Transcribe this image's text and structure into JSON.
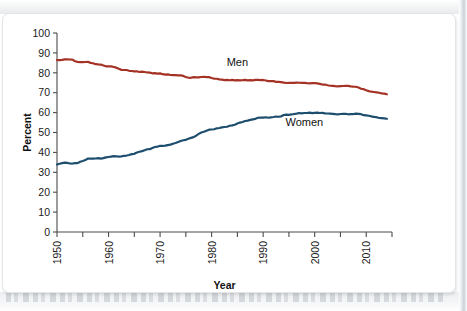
{
  "figure": {
    "background_color": "#ffffff",
    "card_border_color": "#e3e5e7"
  },
  "chart_data": {
    "type": "line",
    "title": "",
    "xlabel": "Year",
    "ylabel": "Percent",
    "xlim": [
      1950,
      2015
    ],
    "ylim": [
      0,
      100
    ],
    "grid": false,
    "legend_position": "inline-labels",
    "x_tick_labels": [
      "1950",
      "1960",
      "1970",
      "1980",
      "1990",
      "2000",
      "2010"
    ],
    "x_tick_values": [
      1950,
      1960,
      1970,
      1980,
      1990,
      2000,
      2010
    ],
    "x_minor_tick_values": [
      1955,
      1965,
      1975,
      1985,
      1995,
      2005,
      2015
    ],
    "y_tick_labels": [
      "0",
      "10",
      "20",
      "30",
      "40",
      "50",
      "60",
      "70",
      "80",
      "90",
      "100"
    ],
    "y_tick_values": [
      0,
      10,
      20,
      30,
      40,
      50,
      60,
      70,
      80,
      90,
      100
    ],
    "series": [
      {
        "name": "Men",
        "color": "#a53325",
        "label_x": 1985,
        "label_y": 83.5,
        "x": [
          1950,
          1951,
          1952,
          1953,
          1954,
          1955,
          1956,
          1957,
          1958,
          1959,
          1960,
          1961,
          1962,
          1963,
          1964,
          1965,
          1966,
          1967,
          1968,
          1969,
          1970,
          1971,
          1972,
          1973,
          1974,
          1975,
          1976,
          1977,
          1978,
          1979,
          1980,
          1981,
          1982,
          1983,
          1984,
          1985,
          1986,
          1987,
          1988,
          1989,
          1990,
          1991,
          1992,
          1993,
          1994,
          1995,
          1996,
          1997,
          1998,
          1999,
          2000,
          2001,
          2002,
          2003,
          2004,
          2005,
          2006,
          2007,
          2008,
          2009,
          2010,
          2011,
          2012,
          2013,
          2014
        ],
        "values": [
          86.4,
          86.5,
          86.8,
          86.6,
          85.5,
          85.4,
          85.5,
          84.8,
          84.2,
          83.7,
          83.3,
          82.9,
          82.0,
          81.4,
          81.0,
          80.7,
          80.4,
          80.4,
          80.1,
          79.8,
          79.7,
          79.1,
          78.9,
          78.8,
          78.7,
          77.9,
          77.5,
          77.7,
          77.9,
          77.8,
          77.4,
          77.0,
          76.6,
          76.4,
          76.4,
          76.3,
          76.3,
          76.2,
          76.2,
          76.4,
          76.4,
          75.8,
          75.8,
          75.4,
          75.1,
          75.0,
          74.9,
          75.0,
          74.9,
          74.7,
          74.8,
          74.4,
          74.1,
          73.5,
          73.3,
          73.3,
          73.5,
          73.2,
          73.0,
          72.0,
          71.2,
          70.5,
          70.2,
          69.7,
          69.2
        ]
      },
      {
        "name": "Women",
        "color": "#1d4e6e",
        "label_x": 1998,
        "label_y": 53.5,
        "x": [
          1950,
          1951,
          1952,
          1953,
          1954,
          1955,
          1956,
          1957,
          1958,
          1959,
          1960,
          1961,
          1962,
          1963,
          1964,
          1965,
          1966,
          1967,
          1968,
          1969,
          1970,
          1971,
          1972,
          1973,
          1974,
          1975,
          1976,
          1977,
          1978,
          1979,
          1980,
          1981,
          1982,
          1983,
          1984,
          1985,
          1986,
          1987,
          1988,
          1989,
          1990,
          1991,
          1992,
          1993,
          1994,
          1995,
          1996,
          1997,
          1998,
          1999,
          2000,
          2001,
          2002,
          2003,
          2004,
          2005,
          2006,
          2007,
          2008,
          2009,
          2010,
          2011,
          2012,
          2013,
          2014
        ],
        "values": [
          33.9,
          34.6,
          34.7,
          34.4,
          34.6,
          35.7,
          36.9,
          36.9,
          37.1,
          37.1,
          37.7,
          38.1,
          37.9,
          38.3,
          38.7,
          39.3,
          40.3,
          41.1,
          41.6,
          42.7,
          43.3,
          43.4,
          43.9,
          44.7,
          45.7,
          46.3,
          47.3,
          48.4,
          50.0,
          50.9,
          51.5,
          52.1,
          52.6,
          52.9,
          53.6,
          54.5,
          55.3,
          56.0,
          56.6,
          57.4,
          57.5,
          57.4,
          57.8,
          57.9,
          58.8,
          58.9,
          59.3,
          59.8,
          59.8,
          60.0,
          59.9,
          59.8,
          59.6,
          59.5,
          59.2,
          59.3,
          59.4,
          59.3,
          59.5,
          59.2,
          58.6,
          58.1,
          57.7,
          57.2,
          56.9
        ]
      }
    ]
  }
}
